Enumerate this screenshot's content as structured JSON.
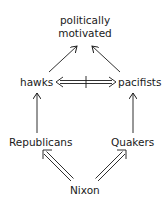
{
  "diagram": {
    "type": "inheritance-network",
    "nodes": {
      "politically_motivated": {
        "line1": "politically",
        "line2": "motivated"
      },
      "hawks": {
        "label": "hawks"
      },
      "pacifists": {
        "label": "pacifists"
      },
      "republicans": {
        "label": "Republicans"
      },
      "quakers": {
        "label": "Quakers"
      },
      "nixon": {
        "label": "Nixon"
      }
    },
    "edges": [
      {
        "from": "Nixon",
        "to": "Republicans",
        "style": "double-strict"
      },
      {
        "from": "Nixon",
        "to": "Quakers",
        "style": "double-strict"
      },
      {
        "from": "Republicans",
        "to": "hawks",
        "style": "single-defeasible"
      },
      {
        "from": "Quakers",
        "to": "pacifists",
        "style": "single-defeasible"
      },
      {
        "from": "hawks",
        "to": "politically motivated",
        "style": "single-defeasible"
      },
      {
        "from": "pacifists",
        "to": "politically motivated",
        "style": "single-defeasible"
      },
      {
        "from": "hawks",
        "to": "pacifists",
        "style": "double-negated-bidirectional"
      }
    ],
    "colors": {
      "stroke": "#1a1a1a",
      "background": "#ffffff"
    }
  }
}
